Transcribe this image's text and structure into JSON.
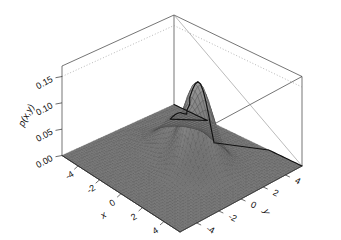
{
  "figure": {
    "kind": "surface-plot-3d",
    "background_color": "#ffffff",
    "line_color": "#3a3a3a",
    "mesh_color": "#4a4a4a",
    "surface_fill_color": "#8c8c8c",
    "ridge_color": "#111111"
  },
  "chart_data": {
    "type": "surface",
    "title": "",
    "subtitle": "",
    "xlabel": "x",
    "ylabel": "y",
    "zlabel": "p(x,y)",
    "grid": true,
    "legend": "none",
    "projection": "3d-perspective",
    "xlim": [
      -5.5,
      5.5
    ],
    "ylim": [
      -5.5,
      5.5
    ],
    "zlim": [
      0.0,
      0.17
    ],
    "x_ticks": [
      -4,
      -2,
      0,
      2,
      4
    ],
    "x_tick_labels": [
      "-4",
      "-2",
      "0",
      "2",
      "4"
    ],
    "y_ticks": [
      -4,
      -2,
      0,
      2,
      4
    ],
    "y_tick_labels": [
      "-4",
      "-2",
      "0",
      "2",
      "4"
    ],
    "z_ticks": [
      0.0,
      0.05,
      0.1,
      0.15
    ],
    "z_tick_labels": [
      "0.00",
      "0.05",
      "0.10",
      "0.15"
    ],
    "model": "gaussian-mixture",
    "components": [
      {
        "name": "main-peak",
        "weight": 0.65,
        "mean_x": 1.1,
        "mean_y": 0.55,
        "sigma_x": 0.95,
        "sigma_y": 1.05,
        "peak_value": 0.163
      },
      {
        "name": "secondary-peak",
        "weight": 0.35,
        "mean_x": -1.35,
        "mean_y": 1.45,
        "sigma_x": 1.15,
        "sigma_y": 1.15,
        "peak_value": 0.072
      }
    ],
    "peak_value_max": 0.163,
    "mesh_resolution": 46
  },
  "axes": {
    "z": {
      "label": "p(x,y)",
      "tick_labels": [
        "0.15",
        "0.10",
        "0.05",
        "0.00"
      ]
    },
    "x": {
      "label": "x",
      "tick_labels": [
        "-4",
        "-2",
        "0",
        "2",
        "4"
      ]
    },
    "y": {
      "label": "y",
      "tick_labels": [
        "4",
        "2",
        "0",
        "-2",
        "-4"
      ]
    }
  }
}
